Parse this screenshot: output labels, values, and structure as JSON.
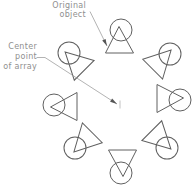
{
  "canvas": {
    "width": 194,
    "height": 187,
    "background": "#ffffff"
  },
  "colors": {
    "object_stroke": "#606060",
    "leader_stroke": "#9a9a9a",
    "arrowhead_fill": "#555555",
    "text": "#8f8f8f",
    "center_marker": "#a8a8a8"
  },
  "labels": {
    "original_object": {
      "line1": "Original",
      "line2": "object"
    },
    "center_point": {
      "line1": "Center",
      "line2": "point",
      "line3": "of array"
    }
  },
  "diagram": {
    "type": "polar-array-illustration",
    "object_shape": {
      "circle_radius": 11,
      "triangle_points": "-2,-3.5 12.5,23 -15.5,23",
      "stroke_width": 1
    },
    "array_objects": [
      {
        "id": "top",
        "cx": 121,
        "cy": 30,
        "rotation": 0
      },
      {
        "id": "top-right",
        "cx": 170,
        "cy": 54,
        "rotation": 45
      },
      {
        "id": "right",
        "cx": 180,
        "cy": 100,
        "rotation": 90
      },
      {
        "id": "bottom-right",
        "cx": 167,
        "cy": 148,
        "rotation": 135
      },
      {
        "id": "bottom",
        "cx": 121,
        "cy": 173,
        "rotation": 180
      },
      {
        "id": "bottom-left",
        "cx": 75,
        "cy": 148,
        "rotation": 225
      },
      {
        "id": "left",
        "cx": 54,
        "cy": 105,
        "rotation": 270
      },
      {
        "id": "top-left",
        "cx": 69,
        "cy": 53,
        "rotation": 315
      }
    ],
    "leaders": [
      {
        "id": "original-object-leader",
        "points": [
          [
            90,
            11.5
          ],
          [
            107,
            46
          ]
        ]
      },
      {
        "id": "center-point-leader",
        "points": [
          [
            36.5,
            57.5
          ],
          [
            45,
            57.5
          ],
          [
            117,
            104
          ]
        ]
      }
    ],
    "arrowhead": {
      "length": 7,
      "half_width": 1.9
    },
    "center_marker": {
      "x": 120,
      "y1": 100.5,
      "y2": 108.5
    }
  }
}
